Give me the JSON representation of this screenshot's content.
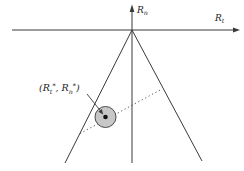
{
  "figure": {
    "axes": {
      "vertical_label_base": "R",
      "vertical_label_sub": "n",
      "horizontal_label_base": "R",
      "horizontal_label_sub": "t"
    },
    "point_label": {
      "p1": "(R",
      "sub1": "t",
      "sup1": "*",
      "p2": ", R",
      "sub2": "n",
      "sup2": "*",
      "p3": ")"
    }
  },
  "colors": {
    "bg": "#ffffff",
    "line": "#3a3a3a",
    "text": "#1c1c1c",
    "circle-fill": "#c7c7c7",
    "circle-stroke": "#4a4a4a",
    "dot": "#111111"
  }
}
